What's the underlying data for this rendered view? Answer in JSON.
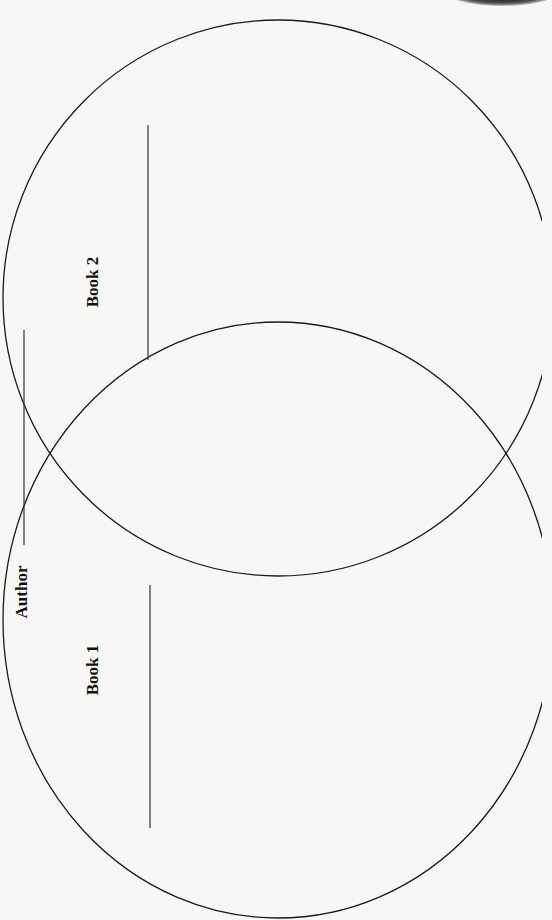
{
  "worksheet": {
    "author_label": "Author",
    "book1_label": "Book 1",
    "book2_label": "Book 2",
    "colors": {
      "ink": "#1a1a1a",
      "paper": "#f7f7f6"
    }
  },
  "diagram": {
    "type": "venn",
    "orientation": "rotated-90",
    "sets": [
      {
        "id": "book1",
        "label": "Book 1",
        "cx": 278,
        "cy": 620,
        "rx": 275,
        "ry": 298
      },
      {
        "id": "book2",
        "label": "Book 2",
        "cx": 278,
        "cy": 298,
        "rx": 275,
        "ry": 278
      }
    ],
    "write_lines": [
      {
        "id": "author-line",
        "x": 24,
        "y1": 330,
        "y2": 545
      },
      {
        "id": "book1-line",
        "x": 150,
        "y1": 585,
        "y2": 828
      },
      {
        "id": "book2-line",
        "x": 148,
        "y1": 125,
        "y2": 360
      }
    ]
  }
}
